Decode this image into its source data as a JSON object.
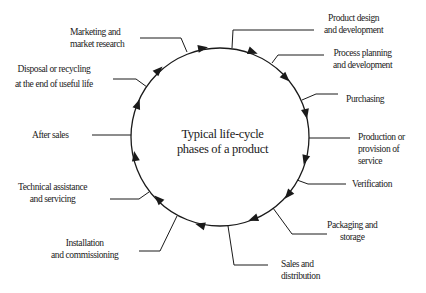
{
  "diagram": {
    "center_title": [
      "Typical life-cycle",
      "phases of a product"
    ],
    "phases": [
      {
        "id": "product-design",
        "lines": [
          "Product design",
          "and development"
        ]
      },
      {
        "id": "process-planning",
        "lines": [
          "Process planning",
          "and development"
        ]
      },
      {
        "id": "purchasing",
        "lines": [
          "Purchasing"
        ]
      },
      {
        "id": "production",
        "lines": [
          "Production or",
          "provision of",
          "service"
        ]
      },
      {
        "id": "verification",
        "lines": [
          "Verification"
        ]
      },
      {
        "id": "packaging",
        "lines": [
          "Packaging and",
          "storage"
        ]
      },
      {
        "id": "sales",
        "lines": [
          "Sales and",
          "distribution"
        ]
      },
      {
        "id": "installation",
        "lines": [
          "Installation",
          "and commissioning"
        ]
      },
      {
        "id": "technical-assistance",
        "lines": [
          "Technical assistance",
          "and servicing"
        ]
      },
      {
        "id": "after-sales",
        "lines": [
          "After sales"
        ]
      },
      {
        "id": "disposal",
        "lines": [
          "Disposal or recycling",
          "at the end of useful life"
        ]
      },
      {
        "id": "marketing",
        "lines": [
          "Marketing and",
          "market research"
        ]
      }
    ],
    "flow_direction": "clockwise",
    "colors": {
      "line": "#1a1a1a",
      "background": "#ffffff"
    }
  }
}
